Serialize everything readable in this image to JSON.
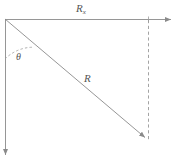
{
  "figure": {
    "name": "vector-decomposition-diagram",
    "background_color": "#ffffff",
    "line_color": "#8a8a8a",
    "label_color": "#555555",
    "width": 180,
    "height": 167
  },
  "labels": {
    "horizontal_component": {
      "base": "R",
      "subscript": "x",
      "full": "Rx"
    },
    "resultant": {
      "base": "R",
      "full": "R"
    },
    "angle": {
      "symbol": "θ",
      "full": "θ"
    }
  },
  "geometry": {
    "origin": {
      "x": 5,
      "y": 19
    },
    "horizontal_arrow": {
      "from": {
        "x": 5,
        "y": 19
      },
      "to": {
        "x": 173,
        "y": 19
      },
      "style": "solid",
      "arrowhead": "end"
    },
    "vertical_axis_arrow": {
      "from": {
        "x": 5,
        "y": 19
      },
      "to": {
        "x": 5,
        "y": 158
      },
      "style": "solid",
      "arrowhead": "end"
    },
    "resultant_arrow": {
      "from": {
        "x": 5,
        "y": 19
      },
      "to": {
        "x": 148,
        "y": 140
      },
      "style": "solid",
      "arrowhead": "end"
    },
    "dashed_drop_line": {
      "from": {
        "x": 148,
        "y": 20
      },
      "to": {
        "x": 148,
        "y": 140
      },
      "style": "dashed"
    },
    "angle_arc": {
      "center": {
        "x": 5,
        "y": 19
      },
      "radius": 40,
      "style": "dashed",
      "from_ray": "vertical-axis",
      "to_ray": "resultant"
    },
    "tick_mark": {
      "x": 148,
      "y": 19
    }
  }
}
